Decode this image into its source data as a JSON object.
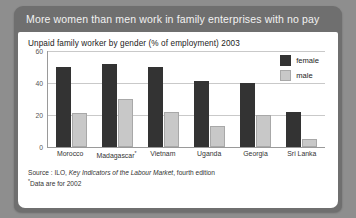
{
  "banner": {
    "text": "More women than men work in family enterprises with no pay"
  },
  "chart_data": {
    "type": "bar",
    "title": "Unpaid family worker by gender (% of employment) 2003",
    "xlabel": "",
    "ylabel": "",
    "ylim": [
      0,
      60
    ],
    "yticks": [
      0,
      20,
      40,
      60
    ],
    "grid": true,
    "legend_position": "top-right",
    "categories": [
      "Morocco",
      "Madagascar*",
      "Vietnam",
      "Uganda",
      "Georgia",
      "Sri Lanka"
    ],
    "series": [
      {
        "name": "female",
        "color": "#333333",
        "values": [
          50,
          52,
          50,
          41,
          40,
          22
        ]
      },
      {
        "name": "male",
        "color": "#c8c8c8",
        "values": [
          21,
          30,
          22,
          13,
          20,
          5
        ]
      }
    ]
  },
  "legend": {
    "items": [
      {
        "label": "female"
      },
      {
        "label": "male"
      }
    ]
  },
  "axis": {
    "yticks": [
      "60",
      "40",
      "20",
      "0"
    ],
    "xlabels": [
      "Morocco",
      "Madagascar",
      "Vietnam",
      "Uganda",
      "Georgia",
      "Sri Lanka"
    ],
    "madagascar_marker": "*"
  },
  "footer": {
    "source_prefix": "Source : ILO, ",
    "source_italic": "Key Indicators of the Labour Market",
    "source_suffix": ", fourth edition",
    "footnote_marker": "*",
    "footnote_text": "Data are for 2002"
  }
}
